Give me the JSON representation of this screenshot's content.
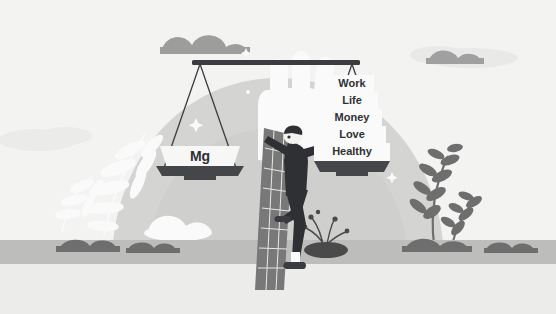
{
  "illustration": {
    "title": "Magnesium outweighs work life balance priorities",
    "scale": {
      "left_pan": {
        "label": "Mg",
        "name": "magnesium-weight-label"
      },
      "right_pan": {
        "stack_name": "life-priorities-pyramid",
        "items": [
          {
            "label": "Work",
            "width": 44
          },
          {
            "label": "Life",
            "width": 52
          },
          {
            "label": "Money",
            "width": 60
          },
          {
            "label": "Love",
            "width": 68
          },
          {
            "label": "Healthy",
            "width": 76
          }
        ]
      }
    },
    "figures": {
      "hand": "open-hand",
      "person": "person-leaning-on-column",
      "column": "tiled-grid-column"
    },
    "sparkles": [
      "sparkle-left",
      "sparkle-right",
      "sparkle-top",
      "sparkle-mid"
    ]
  },
  "colors": {
    "background": "#f3f3f2",
    "backdrop_circle": "#d5d5d4",
    "backdrop_mid": "#c9c9c8",
    "ground": "#ececeb",
    "ground_band": "#bdbdbc",
    "cloud_light": "#e2e2e1",
    "cloud_dark": "#9a9a9a",
    "foliage_dark": "#6e6e6e",
    "foliage_white": "#fafafa",
    "beam": "#3b3c3f",
    "pan_dark": "#45464a",
    "pan_light": "#f7f7f6",
    "string": "#3b3c3f",
    "person_dark": "#2f3033",
    "person_skin": "#f2f2f1",
    "label_box": "#fafafa",
    "text": "#2f3033"
  }
}
